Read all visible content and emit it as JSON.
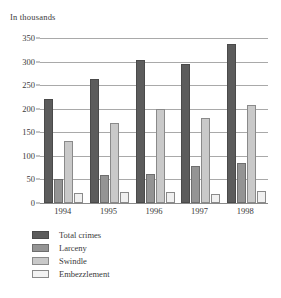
{
  "chart_data": {
    "type": "bar",
    "title": "In thousands",
    "xlabel": "",
    "ylabel": "In thousands",
    "categories": [
      "1994",
      "1995",
      "1996",
      "1997",
      "1998"
    ],
    "series": [
      {
        "name": "Total crimes",
        "color": "#5c5c5c",
        "values": [
          221,
          264,
          303,
          294,
          337
        ]
      },
      {
        "name": "Larceny",
        "color": "#949494",
        "values": [
          52,
          59,
          62,
          78,
          85
        ]
      },
      {
        "name": "Swindle",
        "color": "#c9c9c9",
        "values": [
          132,
          170,
          199,
          180,
          208
        ]
      },
      {
        "name": "Embezzlement",
        "color": "#f0f0f0",
        "values": [
          22,
          23,
          23,
          20,
          25
        ]
      }
    ],
    "ylim": [
      0,
      350
    ],
    "yticks": [
      0,
      50,
      100,
      150,
      200,
      250,
      300,
      350
    ],
    "ytick_labels": [
      "0",
      "50",
      "100",
      "150",
      "200",
      "250",
      "300",
      "350"
    ],
    "grid": true,
    "legend_position": "bottom-left"
  }
}
